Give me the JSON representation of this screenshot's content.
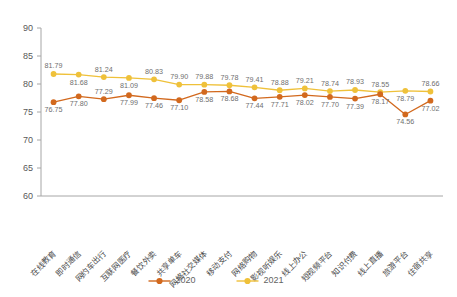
{
  "chart_data": {
    "type": "line",
    "title": "",
    "xlabel": "",
    "ylabel": "",
    "ylim": [
      60,
      90
    ],
    "yticks": [
      60,
      65,
      70,
      75,
      80,
      85,
      90
    ],
    "grid": false,
    "legend_position": "bottom-center",
    "categories": [
      "在线教育",
      "即时通信",
      "网约车出行",
      "互联网医疗",
      "餐饮外卖",
      "共享单车",
      "网络社交媒体",
      "移动支付",
      "网络购物",
      "影视听娱乐",
      "线上办公",
      "短视频平台",
      "知识付费",
      "线上直播",
      "旅游平台",
      "住宿共享"
    ],
    "series": [
      {
        "name": "2020",
        "color": "#D2691E",
        "values": [
          76.75,
          77.8,
          77.29,
          77.99,
          77.46,
          77.1,
          78.58,
          78.68,
          77.44,
          77.71,
          78.02,
          77.7,
          77.39,
          78.17,
          74.56,
          77.02
        ]
      },
      {
        "name": "2021",
        "color": "#EFC13A",
        "values": [
          81.79,
          81.68,
          81.24,
          81.09,
          80.83,
          79.9,
          79.88,
          79.78,
          79.41,
          78.88,
          79.21,
          78.74,
          78.93,
          78.55,
          78.79,
          78.66
        ]
      }
    ],
    "value_label_positions_2020": [
      "below",
      "below",
      "above",
      "below",
      "below",
      "below",
      "below",
      "below",
      "below",
      "below",
      "below",
      "below",
      "below",
      "below",
      "below",
      "below"
    ],
    "value_label_positions_2021": [
      "above",
      "below",
      "above",
      "below",
      "above",
      "above",
      "above",
      "above",
      "above",
      "above",
      "above",
      "above",
      "above",
      "above",
      "below",
      "above"
    ]
  },
  "legend": {
    "items": [
      {
        "label": "2020",
        "color": "#D2691E"
      },
      {
        "label": "2021",
        "color": "#EFC13A"
      }
    ]
  },
  "axis": {
    "y_tick_labels": [
      "90",
      "85",
      "80",
      "75",
      "70",
      "65",
      "60"
    ]
  }
}
